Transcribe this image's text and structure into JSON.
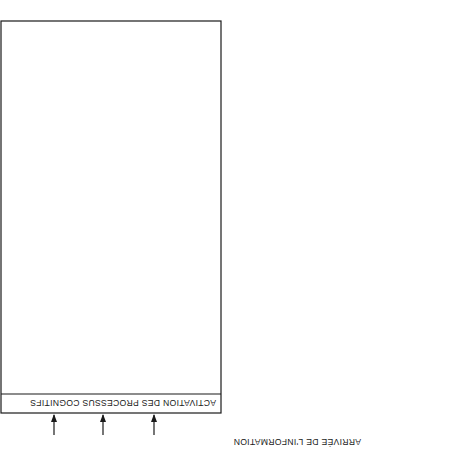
{
  "diagram": {
    "orientation": "rotated 180 degrees",
    "input_label": "ARRIVÉE DE L'INFORMATION",
    "output_label": "Comportement",
    "activation": {
      "title": "ACTIVATION DES PROCESSUS COGNITIFS",
      "stages": [
        {
          "title": "EXPOSITION À L'INFORMATION",
          "steps": []
        },
        {
          "title": "RÉCEPTION DE L'INFORMATION",
          "steps": [
            "Éveil",
            "Attention"
          ]
        },
        {
          "title": "ANALYSE COGNITIVE",
          "steps": [
            "Compréhension",
            "Acceptation/Rejet",
            "Rappel"
          ]
        },
        {
          "title": "ATTITUDE",
          "steps": [
            "Emmagasinage/Intégration"
          ]
        }
      ]
    },
    "memory": {
      "title": "MÉMOIRE PERMANENTE",
      "items": [
        "UTILITÉ",
        "PERTINENCE",
        "PREMIÈRE OPINION",
        "SUBJECTIVITÉ"
      ]
    }
  }
}
